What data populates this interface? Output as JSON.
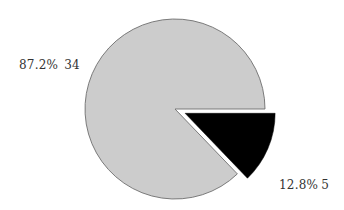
{
  "chart_data": {
    "type": "pie",
    "title": "",
    "categories": [
      "Slice A",
      "Slice B"
    ],
    "values": [
      34,
      5
    ],
    "percentages": [
      "87.2%",
      "12.8%"
    ],
    "colors": [
      "#cccccc",
      "#000000"
    ],
    "exploded": [
      false,
      true
    ],
    "legend": "none",
    "data_labels": [
      {
        "pct": "87.2%",
        "value": "34"
      },
      {
        "pct": "12.8%",
        "value": "5"
      }
    ]
  },
  "labels": {
    "big": {
      "pct": "87.2%",
      "value": "34"
    },
    "small": {
      "pct": "12.8%",
      "value": "5"
    }
  }
}
